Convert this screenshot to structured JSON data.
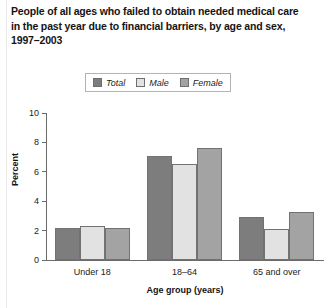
{
  "title": {
    "line1": "People of all ages who failed to obtain needed medical care",
    "line2": "in the past year due to financial barriers, by age and sex,",
    "line3": "1997–2003"
  },
  "colors": {
    "total": "#7d7d7d",
    "male": "#e2e2e2",
    "female": "#a3a3a3",
    "axis": "#6b6b6b",
    "bar_border": "#727272",
    "text": "#1c1c1c",
    "background": "#ffffff"
  },
  "chart_data": {
    "type": "bar",
    "title": "People of all ages who failed to obtain needed medical care in the past year due to financial barriers, by age and sex, 1997–2003",
    "xlabel": "Age group (years)",
    "ylabel": "Percent",
    "categories": [
      "Under 18",
      "18–64",
      "65 and over"
    ],
    "series": [
      {
        "name": "Total",
        "values": [
          2.2,
          7.1,
          2.9
        ],
        "color": "#7d7d7d"
      },
      {
        "name": "Male",
        "values": [
          2.3,
          6.5,
          2.1
        ],
        "color": "#e2e2e2"
      },
      {
        "name": "Female",
        "values": [
          2.2,
          7.6,
          3.3
        ],
        "color": "#a3a3a3"
      }
    ],
    "ylim": [
      0,
      10
    ],
    "yticks": [
      0,
      2,
      4,
      6,
      8,
      10
    ],
    "ytick_labels": [
      "0",
      "2",
      "4",
      "6",
      "8",
      "10"
    ],
    "grid": false,
    "legend_position": "top-center"
  }
}
